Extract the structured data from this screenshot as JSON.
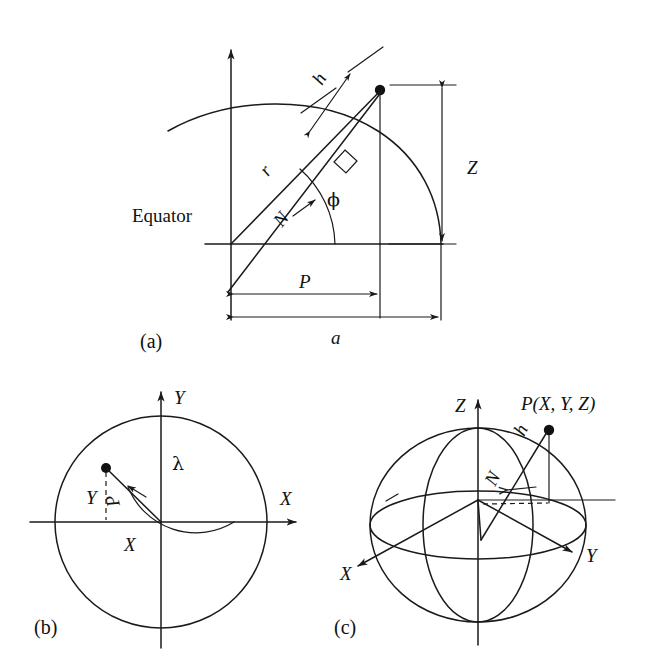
{
  "figure": {
    "background_color": "#ffffff",
    "ink_color": "#1a1a1a"
  },
  "panels": [
    {
      "id": "a",
      "caption": "(a)",
      "description": "Meridian section of the ellipsoid showing ellipsoidal height, geodetic latitude and radii",
      "labels": {
        "equator": "Equator",
        "height": "h",
        "radius": "r",
        "prime_vertical": "N",
        "latitude": "ϕ",
        "z_coordinate": "Z",
        "p_distance": "P",
        "semi_major_axis": "a"
      }
    },
    {
      "id": "b",
      "caption": "(b)",
      "description": "Equatorial plane view showing longitude and the projected radius",
      "labels": {
        "axis_x": "X",
        "axis_y": "Y",
        "coord_x": "X",
        "coord_y": "Y",
        "radius_p": "P",
        "longitude": "λ"
      }
    },
    {
      "id": "c",
      "caption": "(c)",
      "description": "Three dimensional ellipsoid with geocentric Cartesian axes and point P",
      "labels": {
        "axis_x": "X",
        "axis_y": "Y",
        "axis_z": "Z",
        "point": "P(X, Y, Z)",
        "height": "h",
        "prime_vertical": "N"
      }
    }
  ]
}
